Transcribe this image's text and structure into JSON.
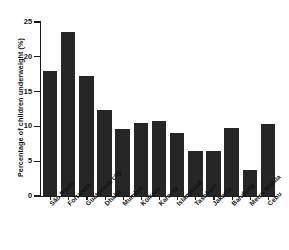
{
  "chart_data": {
    "type": "bar",
    "title": "",
    "xlabel": "",
    "ylabel": "Percentage of children underweight (%)",
    "ylim": [
      0,
      25
    ],
    "yticks": [
      "0",
      "5",
      "10",
      "15",
      "20",
      "25"
    ],
    "grid": false,
    "legend": null,
    "bar_color": "#262626",
    "categories": [
      "São Paulo",
      "Fortaleza",
      "Guatemala city",
      "Dhaka",
      "Mumbai",
      "Kolkata",
      "Karachi",
      "Islamabad",
      "Tashkent",
      "Jakarta",
      "Bandung",
      "Metro Manila",
      "Cebu"
    ],
    "values": [
      18.0,
      23.5,
      17.2,
      12.3,
      9.6,
      10.5,
      10.8,
      9.0,
      6.5,
      6.5,
      9.8,
      3.8,
      10.3
    ]
  }
}
